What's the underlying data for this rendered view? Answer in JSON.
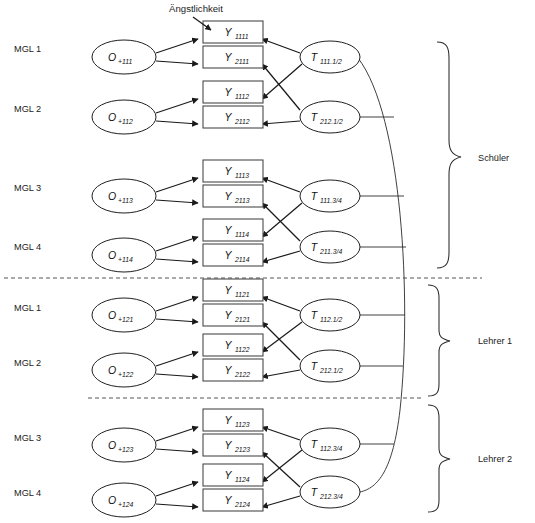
{
  "figure": {
    "caption": "Ängstlichkeit",
    "divider_count": 2
  },
  "row_labels": [
    {
      "text": "MGL 1",
      "y": 48
    },
    {
      "text": "MGL 2",
      "y": 108
    },
    {
      "text": "MGL 3",
      "y": 187
    },
    {
      "text": "MGL 4",
      "y": 246
    },
    {
      "text": "MGL 1",
      "y": 307
    },
    {
      "text": "MGL 2",
      "y": 362
    },
    {
      "text": "MGL 3",
      "y": 437
    },
    {
      "text": "MGL 4",
      "y": 492
    }
  ],
  "group_labels": [
    {
      "text": "Schüler",
      "y": 157
    },
    {
      "text": "Lehrer 1",
      "y": 340
    },
    {
      "text": "Lehrer 2",
      "y": 458
    }
  ],
  "o_nodes": [
    {
      "main": "O",
      "sub": "+111",
      "cx": 124,
      "cy": 57
    },
    {
      "main": "O",
      "sub": "+112",
      "cx": 124,
      "cy": 117
    },
    {
      "main": "O",
      "sub": "+113",
      "cx": 124,
      "cy": 196
    },
    {
      "main": "O",
      "sub": "+114",
      "cx": 124,
      "cy": 255
    },
    {
      "main": "O",
      "sub": "+121",
      "cx": 124,
      "cy": 315
    },
    {
      "main": "O",
      "sub": "+122",
      "cx": 124,
      "cy": 370
    },
    {
      "main": "O",
      "sub": "+123",
      "cx": 124,
      "cy": 445
    },
    {
      "main": "O",
      "sub": "+124",
      "cx": 124,
      "cy": 500
    }
  ],
  "y_nodes": [
    {
      "main": "Y",
      "sub": "1111",
      "x": 203,
      "y": 32
    },
    {
      "main": "Y",
      "sub": "2111",
      "x": 203,
      "y": 57
    },
    {
      "main": "Y",
      "sub": "1112",
      "x": 203,
      "y": 92
    },
    {
      "main": "Y",
      "sub": "2112",
      "x": 203,
      "y": 117
    },
    {
      "main": "Y",
      "sub": "1113",
      "x": 203,
      "y": 171
    },
    {
      "main": "Y",
      "sub": "2113",
      "x": 203,
      "y": 196
    },
    {
      "main": "Y",
      "sub": "1114",
      "x": 203,
      "y": 230
    },
    {
      "main": "Y",
      "sub": "2114",
      "x": 203,
      "y": 255
    },
    {
      "main": "Y",
      "sub": "1121",
      "x": 203,
      "y": 290
    },
    {
      "main": "Y",
      "sub": "2121",
      "x": 203,
      "y": 315
    },
    {
      "main": "Y",
      "sub": "1122",
      "x": 203,
      "y": 345
    },
    {
      "main": "Y",
      "sub": "2122",
      "x": 203,
      "y": 370
    },
    {
      "main": "Y",
      "sub": "1123",
      "x": 203,
      "y": 420
    },
    {
      "main": "Y",
      "sub": "2123",
      "x": 203,
      "y": 445
    },
    {
      "main": "Y",
      "sub": "1124",
      "x": 203,
      "y": 475
    },
    {
      "main": "Y",
      "sub": "2124",
      "x": 203,
      "y": 500
    }
  ],
  "t_nodes": [
    {
      "main": "T",
      "sub": "111.1/2",
      "cx": 330,
      "cy": 57
    },
    {
      "main": "T",
      "sub": "212.1/2",
      "cx": 330,
      "cy": 117
    },
    {
      "main": "T",
      "sub": "111.3/4",
      "cx": 330,
      "cy": 196
    },
    {
      "main": "T",
      "sub": "211.3/4",
      "cx": 330,
      "cy": 247
    },
    {
      "main": "T",
      "sub": "112.1/2",
      "cx": 330,
      "cy": 315
    },
    {
      "main": "T",
      "sub": "212.1/2",
      "cx": 330,
      "cy": 366
    },
    {
      "main": "T",
      "sub": "112.3/4",
      "cx": 330,
      "cy": 444
    },
    {
      "main": "T",
      "sub": "212.3/4",
      "cx": 330,
      "cy": 492
    }
  ],
  "colors": {
    "stroke": "#1a1a1a",
    "box_stroke": "#4a4a4a",
    "text": "#1b1b1b",
    "background": "#ffffff",
    "divider": "#555555"
  }
}
